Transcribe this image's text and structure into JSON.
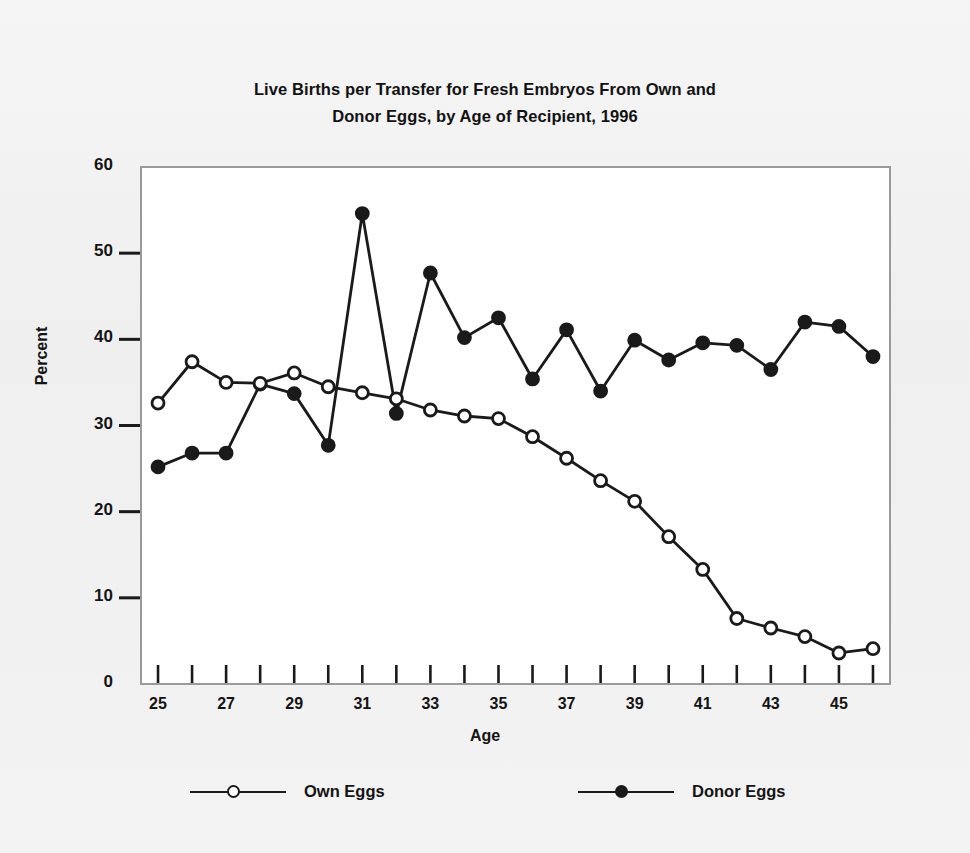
{
  "chart_data": {
    "type": "line",
    "title": "Live Births per Transfer  for Fresh Embryos From Own and\nDonor Eggs, by Age of Recipient, 1996",
    "title_line1": "Live Births per Transfer  for Fresh Embryos From Own and",
    "title_line2": "Donor Eggs, by Age of Recipient, 1996",
    "xlabel": "Age",
    "ylabel": "Percent",
    "grid": false,
    "legend_position": "bottom",
    "xlim": [
      24.5,
      46.5
    ],
    "ylim": [
      0,
      60
    ],
    "ytick_values": [
      0,
      10,
      20,
      30,
      40,
      50,
      60
    ],
    "ytick_labels": [
      "0",
      "10",
      "20",
      "30",
      "40",
      "50",
      "60"
    ],
    "x": [
      25,
      26,
      27,
      28,
      29,
      30,
      31,
      32,
      33,
      34,
      35,
      36,
      37,
      38,
      39,
      40,
      41,
      42,
      43,
      44,
      45,
      46
    ],
    "xtick_values": [
      25,
      26,
      27,
      28,
      29,
      30,
      31,
      32,
      33,
      34,
      35,
      36,
      37,
      38,
      39,
      40,
      41,
      42,
      43,
      44,
      45,
      46
    ],
    "xtick_labels": [
      "25",
      "",
      "27",
      "",
      "29",
      "",
      "31",
      "",
      "33",
      "",
      "35",
      "",
      "37",
      "",
      "39",
      "",
      "41",
      "",
      "43",
      "",
      "45",
      ""
    ],
    "series": [
      {
        "name": "Own Eggs",
        "marker": "open-circle",
        "color": "#1a1a1a",
        "values": [
          32.6,
          37.4,
          35.0,
          34.9,
          36.1,
          34.5,
          33.8,
          33.1,
          31.8,
          31.1,
          30.8,
          28.7,
          26.2,
          23.6,
          21.2,
          17.1,
          13.3,
          7.6,
          6.5,
          5.5,
          3.6,
          4.1
        ]
      },
      {
        "name": "Donor Eggs",
        "marker": "filled-circle",
        "color": "#1a1a1a",
        "values": [
          25.2,
          26.8,
          26.8,
          34.8,
          33.7,
          27.7,
          54.6,
          31.4,
          47.7,
          40.2,
          42.5,
          35.4,
          41.1,
          34.0,
          39.9,
          37.6,
          39.6,
          39.3,
          36.5,
          42.0,
          41.5,
          38.0
        ]
      }
    ]
  },
  "legend": {
    "items": [
      {
        "label": "Own Eggs",
        "marker": "open-circle"
      },
      {
        "label": "Donor Eggs",
        "marker": "filled-circle"
      }
    ]
  },
  "colors": {
    "ink": "#1a1a1a",
    "frame": "#8c8c8c",
    "paper": "#f1f1f1",
    "plot_background": "#ffffff"
  }
}
